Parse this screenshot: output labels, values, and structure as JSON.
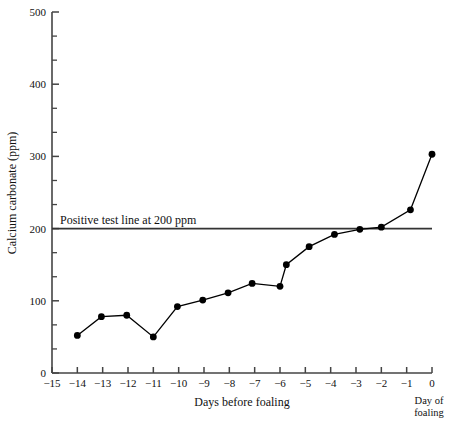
{
  "chart_data": {
    "type": "line",
    "title": "",
    "xlabel": "Days before foaling",
    "ylabel": "Calcium carbonate (ppm)",
    "xlim": [
      -15,
      0
    ],
    "ylim": [
      0,
      500
    ],
    "grid": false,
    "legend": "none",
    "x_tick_labels": [
      "−15",
      "−14",
      "−13",
      "−12",
      "−11",
      "−10",
      "−9",
      "−8",
      "−7",
      "−6",
      "−5",
      "−4",
      "−3",
      "−2",
      "−1",
      "0"
    ],
    "x_tick_values": [
      -15,
      -14,
      -13,
      -12,
      -11,
      -10,
      -9,
      -8,
      -7,
      -6,
      -5,
      -4,
      -3,
      -2,
      -1,
      0
    ],
    "y_tick_labels": [
      "0",
      "100",
      "200",
      "300",
      "400",
      "500"
    ],
    "y_tick_values": [
      0,
      100,
      200,
      300,
      400,
      500
    ],
    "y_minor_step": 33.33,
    "corner_label_line1": "Day of",
    "corner_label_line2": "foaling",
    "series": [
      {
        "name": "Calcium carbonate",
        "marker": "filled-circle",
        "color": "#000000",
        "x": [
          -14.0,
          -13.05,
          -12.05,
          -11.0,
          -10.05,
          -9.05,
          -8.05,
          -7.1,
          -6.0,
          -5.75,
          -4.85,
          -3.85,
          -2.85,
          -2.0,
          -0.85,
          0.0
        ],
        "values": [
          52,
          78,
          80,
          50,
          92,
          101,
          111,
          124,
          120,
          150,
          175,
          192,
          199,
          202,
          226,
          303
        ]
      }
    ],
    "reference_line": {
      "label": "Positive test line at 200 ppm",
      "y_value": 200,
      "color": "#333333"
    }
  },
  "axis_colors": {
    "spine": "#444444",
    "data": "#000000"
  }
}
